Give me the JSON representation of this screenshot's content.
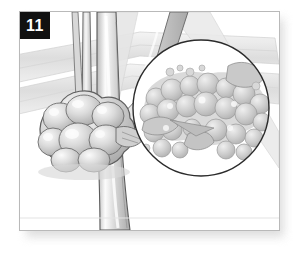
{
  "figure": {
    "number_label": "11",
    "caption": "",
    "style": "grayscale line-and-tone botanical illustration",
    "plate": {
      "background_color": "#ffffff",
      "border_color": "#b9b9b9",
      "shadow_color": "#d9d9d9"
    },
    "badge": {
      "text": "11",
      "background_color": "#111111",
      "text_color": "#ffffff"
    },
    "palette": {
      "outline": "#4a4a4a",
      "tone_light": "#eaeaea",
      "tone_mid": "#cfcfcf",
      "tone_dark": "#a8a8a8",
      "highlight": "#fafafa",
      "inset_ring": "#2b2b2b",
      "inset_fill": "#ffffff",
      "granule_fill": "#cbcbcb",
      "granule_shade": "#b0b0b0",
      "granule_light": "#e6e6e6"
    },
    "elements": [
      {
        "name": "background-leaf-band-upper",
        "description": "pale diagonal leaf blade crossing upper left"
      },
      {
        "name": "background-leaf-band-lower",
        "description": "pale diagonal leaf blade crossing mid right"
      },
      {
        "name": "stem-main",
        "description": "vertical stem running top to bottom through the plate"
      },
      {
        "name": "stem-secondary",
        "description": "thin vertical stem left of the main stem"
      },
      {
        "name": "stem-branch",
        "description": "angled stem leaning to the right from the nodule"
      },
      {
        "name": "nodule-cluster",
        "description": "lumpy rounded gall mass at the stem base, lower left"
      },
      {
        "name": "magnifier-circle",
        "description": "circular inset outlined in dark ink, right of centre"
      },
      {
        "name": "granule-cluster",
        "description": "magnified granular bumpy tissue inside the inset"
      }
    ],
    "inset": {
      "shape": "circle",
      "center_x": 200,
      "center_y": 107,
      "radius": 68,
      "ring_color": "#2b2b2b",
      "ring_width": 1.4
    }
  }
}
